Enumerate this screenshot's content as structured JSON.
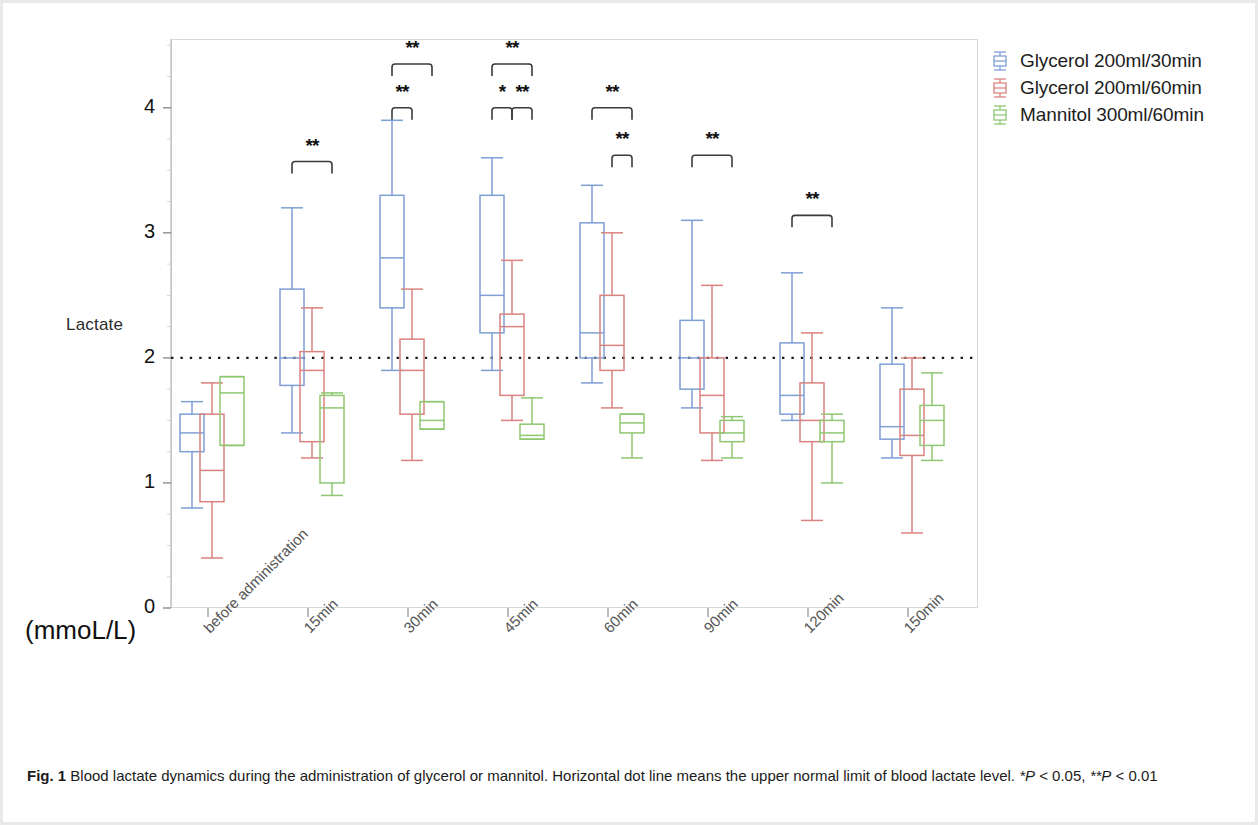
{
  "figure": {
    "units_label": "(mmoL/L)",
    "y_axis_label": "Lactate",
    "caption_prefix": "Fig. 1",
    "caption_text": " Blood lactate dynamics during the administration of glycerol or mannitol. Horizontal dot line means the upper normal limit of blood lactate level. ",
    "caption_sig_1": "*P",
    "caption_sig_1b": " < 0.05, ",
    "caption_sig_2": "**P",
    "caption_sig_2b": " < 0.01"
  },
  "legend": {
    "items": [
      {
        "label": "Glycerol 200ml/30min",
        "color": "#7f9fd4",
        "name": "legend-glycerol-30min"
      },
      {
        "label": "Glycerol 200ml/60min",
        "color": "#d9837f",
        "name": "legend-glycerol-60min"
      },
      {
        "label": "Mannitol 300ml/60min",
        "color": "#8fc772",
        "name": "legend-mannitol-60min"
      }
    ]
  },
  "chart_data": {
    "type": "box",
    "title": "Blood lactate dynamics during the administration of glycerol or mannitol",
    "xlabel": "",
    "ylabel": "Lactate",
    "yunits": "(mmoL/L)",
    "ylim": [
      0,
      4.55
    ],
    "yticks": [
      0,
      1,
      2,
      3,
      4
    ],
    "grid": false,
    "reference_line": {
      "value": 2.0,
      "style": "dotted",
      "meaning": "upper normal limit of blood lactate"
    },
    "legend_position": "top-right",
    "categories": [
      "before administration",
      "15min",
      "30min",
      "45min",
      "60min",
      "90min",
      "120min",
      "150min"
    ],
    "series": [
      {
        "name": "Glycerol 200ml/30min",
        "color": "#7f9fd4",
        "boxes": [
          {
            "category": "before administration",
            "whisker_low": 0.8,
            "q1": 1.25,
            "median": 1.4,
            "q3": 1.55,
            "whisker_high": 1.65
          },
          {
            "category": "15min",
            "whisker_low": 1.4,
            "q1": 1.78,
            "median": 2.0,
            "q3": 2.55,
            "whisker_high": 3.2
          },
          {
            "category": "30min",
            "whisker_low": 1.9,
            "q1": 2.4,
            "median": 2.8,
            "q3": 3.3,
            "whisker_high": 3.9
          },
          {
            "category": "45min",
            "whisker_low": 1.9,
            "q1": 2.2,
            "median": 2.5,
            "q3": 3.3,
            "whisker_high": 3.6
          },
          {
            "category": "60min",
            "whisker_low": 1.8,
            "q1": 2.0,
            "median": 2.2,
            "q3": 3.08,
            "whisker_high": 3.38
          },
          {
            "category": "90min",
            "whisker_low": 1.6,
            "q1": 1.75,
            "median": 2.0,
            "q3": 2.3,
            "whisker_high": 3.1
          },
          {
            "category": "120min",
            "whisker_low": 1.5,
            "q1": 1.55,
            "median": 1.7,
            "q3": 2.12,
            "whisker_high": 2.68
          },
          {
            "category": "150min",
            "whisker_low": 1.2,
            "q1": 1.35,
            "median": 1.45,
            "q3": 1.95,
            "whisker_high": 2.4
          }
        ]
      },
      {
        "name": "Glycerol 200ml/60min",
        "color": "#d9837f",
        "boxes": [
          {
            "category": "before administration",
            "whisker_low": 0.4,
            "q1": 0.85,
            "median": 1.1,
            "q3": 1.55,
            "whisker_high": 1.8
          },
          {
            "category": "15min",
            "whisker_low": 1.2,
            "q1": 1.33,
            "median": 1.9,
            "q3": 2.05,
            "whisker_high": 2.4
          },
          {
            "category": "30min",
            "whisker_low": 1.18,
            "q1": 1.55,
            "median": 1.9,
            "q3": 2.15,
            "whisker_high": 2.55
          },
          {
            "category": "45min",
            "whisker_low": 1.5,
            "q1": 1.7,
            "median": 2.25,
            "q3": 2.35,
            "whisker_high": 2.78
          },
          {
            "category": "60min",
            "whisker_low": 1.6,
            "q1": 1.9,
            "median": 2.1,
            "q3": 2.5,
            "whisker_high": 3.0
          },
          {
            "category": "90min",
            "whisker_low": 1.18,
            "q1": 1.4,
            "median": 1.7,
            "q3": 2.0,
            "whisker_high": 2.58
          },
          {
            "category": "120min",
            "whisker_low": 0.7,
            "q1": 1.33,
            "median": 1.5,
            "q3": 1.8,
            "whisker_high": 2.2
          },
          {
            "category": "150min",
            "whisker_low": 0.6,
            "q1": 1.22,
            "median": 1.38,
            "q3": 1.75,
            "whisker_high": 2.0
          }
        ]
      },
      {
        "name": "Mannitol 300ml/60min",
        "color": "#8fc772",
        "boxes": [
          {
            "category": "before administration",
            "whisker_low": 1.3,
            "q1": 1.3,
            "median": 1.72,
            "q3": 1.85,
            "whisker_high": 1.85
          },
          {
            "category": "15min",
            "whisker_low": 0.9,
            "q1": 1.0,
            "median": 1.6,
            "q3": 1.7,
            "whisker_high": 1.72
          },
          {
            "category": "30min",
            "whisker_low": 1.43,
            "q1": 1.43,
            "median": 1.5,
            "q3": 1.65,
            "whisker_high": 1.65
          },
          {
            "category": "45min",
            "whisker_low": 1.35,
            "q1": 1.35,
            "median": 1.38,
            "q3": 1.47,
            "whisker_high": 1.68
          },
          {
            "category": "60min",
            "whisker_low": 1.2,
            "q1": 1.4,
            "median": 1.48,
            "q3": 1.55,
            "whisker_high": 1.55
          },
          {
            "category": "90min",
            "whisker_low": 1.2,
            "q1": 1.33,
            "median": 1.4,
            "q3": 1.5,
            "whisker_high": 1.53
          },
          {
            "category": "120min",
            "whisker_low": 1.0,
            "q1": 1.33,
            "median": 1.4,
            "q3": 1.5,
            "whisker_high": 1.55
          },
          {
            "category": "150min",
            "whisker_low": 1.18,
            "q1": 1.3,
            "median": 1.5,
            "q3": 1.62,
            "whisker_high": 1.88
          }
        ]
      }
    ],
    "significance_brackets": [
      {
        "category": "15min",
        "from": "Glycerol 200ml/30min",
        "to": "Mannitol 300ml/60min",
        "label": "**",
        "y": 3.57
      },
      {
        "category": "30min",
        "from": "Glycerol 200ml/30min",
        "to": "Mannitol 300ml/60min",
        "label": "**",
        "y": 4.35
      },
      {
        "category": "30min",
        "from": "Glycerol 200ml/30min",
        "to": "Glycerol 200ml/60min",
        "label": "**",
        "y": 4.0
      },
      {
        "category": "45min",
        "from": "Glycerol 200ml/30min",
        "to": "Mannitol 300ml/60min",
        "label": "**",
        "y": 4.35
      },
      {
        "category": "45min",
        "from": "Glycerol 200ml/30min",
        "to": "Glycerol 200ml/60min",
        "label": "*",
        "y": 4.0
      },
      {
        "category": "45min",
        "from": "Glycerol 200ml/60min",
        "to": "Mannitol 300ml/60min",
        "label": "**",
        "y": 4.0
      },
      {
        "category": "60min",
        "from": "Glycerol 200ml/30min",
        "to": "Mannitol 300ml/60min",
        "label": "**",
        "y": 4.0
      },
      {
        "category": "60min",
        "from": "Glycerol 200ml/60min",
        "to": "Mannitol 300ml/60min",
        "label": "**",
        "y": 3.62
      },
      {
        "category": "90min",
        "from": "Glycerol 200ml/30min",
        "to": "Mannitol 300ml/60min",
        "label": "**",
        "y": 3.62
      },
      {
        "category": "120min",
        "from": "Glycerol 200ml/30min",
        "to": "Mannitol 300ml/60min",
        "label": "**",
        "y": 3.14
      }
    ]
  }
}
